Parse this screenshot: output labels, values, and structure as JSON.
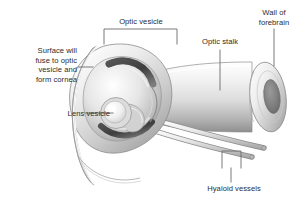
{
  "figure": {
    "background_color": "#ffffff",
    "line_color": "#6b6b6b",
    "text_color": "#2b2b2b",
    "width": 305,
    "height": 210
  },
  "labels": {
    "surface": "Surface will\nfuse to optic\nvesicle and\nform cornea",
    "optic_vesicle": "Optic vesicle",
    "optic_stalk": "Optic stalk",
    "wall_of_forebrain": "Wall of\nforebrain",
    "lens_vesicle": "Lens vesicle",
    "hyaloid_vessels": "Hyaloid vessels"
  },
  "structures": {
    "surface_ectoderm": "surface-ectoderm-crescent",
    "optic_cup": "optic-cup",
    "optic_cup_inner_layer": "optic-cup-inner-layer",
    "lens_vesicle": "lens-vesicle-sphere",
    "optic_stalk": "optic-stalk-funnel",
    "forebrain_wall_ring": "forebrain-wall-ring",
    "forebrain_lumen": "forebrain-lumen-opening",
    "hyaloid_vessel_upper": "hyaloid-vessel-upper",
    "hyaloid_vessel_lower": "hyaloid-vessel-lower"
  },
  "leaders": {
    "surface": "line-from-surface-label-to-ectoderm",
    "optic_vesicle": "square-bracket-spanning-optic-vesicle",
    "optic_stalk": "vertical-line-to-stalk",
    "wall_of_forebrain": "vertical-line-to-forebrain-ring",
    "lens_vesicle": "horizontal-line-to-lens",
    "hyaloid_vessels": "square-bracket-spanning-two-vessels"
  },
  "palette": {
    "shade_light": "#f2f2f2",
    "shade_mid": "#cfcfcf",
    "shade_dark": "#8e8e8e",
    "shade_darkest": "#4a4a4a",
    "outline": "#7a7a7a"
  }
}
